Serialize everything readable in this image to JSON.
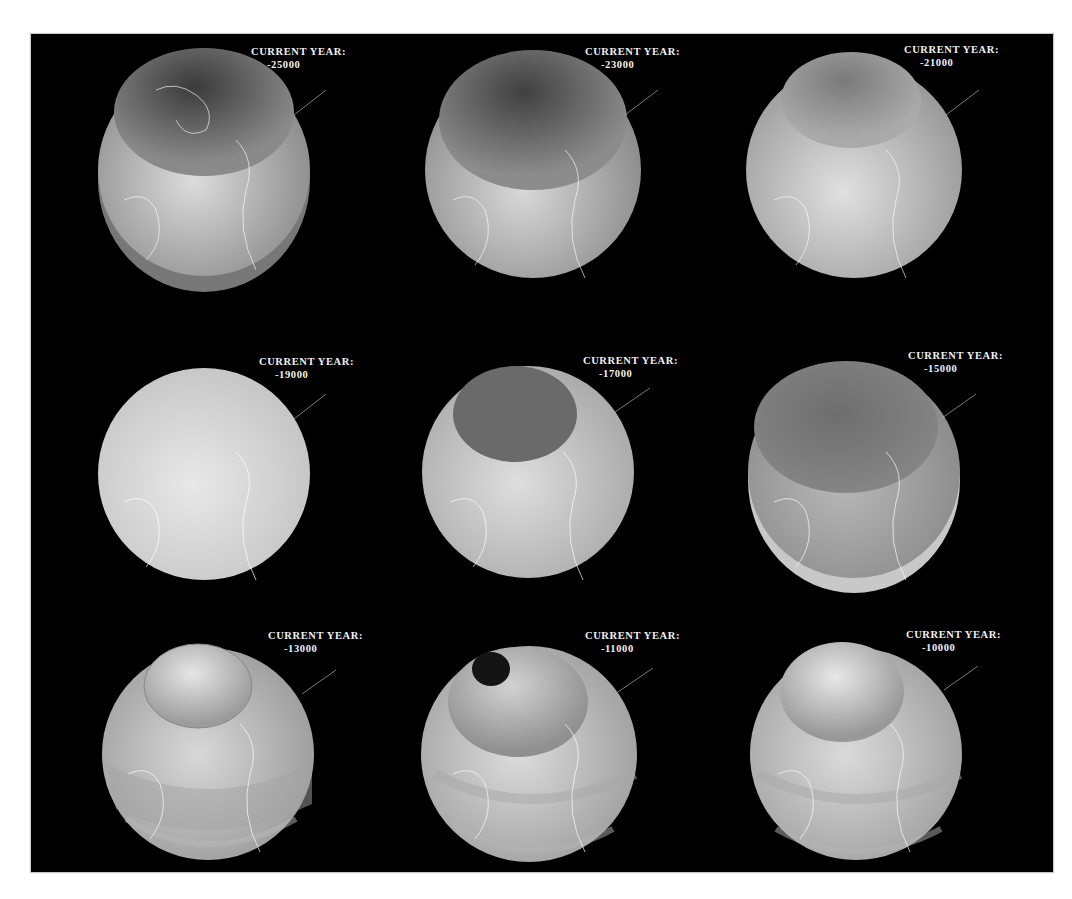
{
  "figure": {
    "background": "#000000",
    "label_prefix": "CURRENT YEAR:",
    "panels": [
      {
        "year": "-25000",
        "cap": "dark-large",
        "band": "lower-shadow"
      },
      {
        "year": "-23000",
        "cap": "dark-large",
        "band": "none"
      },
      {
        "year": "-21000",
        "cap": "faint-dark",
        "band": "none"
      },
      {
        "year": "-19000",
        "cap": "none",
        "band": "none"
      },
      {
        "year": "-17000",
        "cap": "dark-sharp",
        "band": "none"
      },
      {
        "year": "-15000",
        "cap": "dark-large",
        "band": "lower-ring"
      },
      {
        "year": "-13000",
        "cap": "light-inner",
        "band": "multi-ring"
      },
      {
        "year": "-11000",
        "cap": "hole-center",
        "band": "multi-ring"
      },
      {
        "year": "-10000",
        "cap": "light-inner",
        "band": "multi-ring"
      }
    ]
  }
}
